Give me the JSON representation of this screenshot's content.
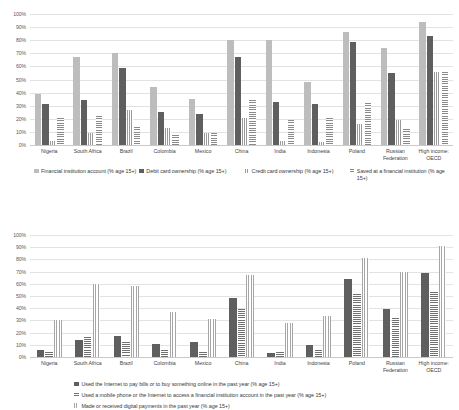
{
  "chart_data": [
    {
      "id": "financial-inclusion-indicators",
      "type": "bar",
      "title": "",
      "xlabel": "",
      "ylabel": "",
      "ylim": [
        0,
        100
      ],
      "ytick_labels": [
        "100%",
        "90%",
        "80%",
        "70%",
        "60%",
        "50%",
        "40%",
        "30%",
        "20%",
        "10%",
        "0%"
      ],
      "ytick_values": [
        100,
        90,
        80,
        70,
        60,
        50,
        40,
        30,
        20,
        10,
        0
      ],
      "grid": true,
      "legend_position": "bottom",
      "categories": [
        "Nigeria",
        "South Africa",
        "Brazil",
        "Colombia",
        "Mexico",
        "China",
        "India",
        "Indonesia",
        "Poland",
        "Russian Federation",
        "High income: OECD"
      ],
      "series": [
        {
          "name": "Financial institution account (% age 15+)",
          "texture": "dotted",
          "values": [
            39,
            67,
            70,
            44,
            35,
            80,
            80,
            48,
            86,
            74,
            94
          ]
        },
        {
          "name": "Debit card ownership (% age 15+)",
          "texture": "solid",
          "values": [
            31,
            34,
            59,
            25,
            24,
            67,
            33,
            31,
            79,
            55,
            83
          ]
        },
        {
          "name": "Credit card ownership (% age 15+)",
          "texture": "vstripe",
          "values": [
            3,
            9,
            27,
            13,
            9,
            21,
            3,
            2,
            16,
            19,
            56
          ]
        },
        {
          "name": "Saved at a financial institution (% age 15+)",
          "texture": "hstripe",
          "values": [
            21,
            22,
            14,
            8,
            9,
            34,
            19,
            21,
            32,
            12,
            56
          ]
        }
      ]
    },
    {
      "id": "digital-payments-indicators",
      "type": "bar",
      "title": "",
      "xlabel": "",
      "ylabel": "",
      "ylim": [
        0,
        100
      ],
      "ytick_labels": [
        "100%",
        "90%",
        "80%",
        "70%",
        "60%",
        "50%",
        "40%",
        "30%",
        "20%",
        "10%",
        "0%"
      ],
      "ytick_values": [
        100,
        90,
        80,
        70,
        60,
        50,
        40,
        30,
        20,
        10,
        0
      ],
      "grid": true,
      "legend_position": "bottom",
      "categories": [
        "Nigeria",
        "South Africa",
        "Brazil",
        "Colombia",
        "Mexico",
        "China",
        "India",
        "Indonesia",
        "Poland",
        "Russian Federation",
        "High income: OECD"
      ],
      "series": [
        {
          "name": "Used the Internet to pay bills or to buy something online in the past year (% age 15+)",
          "texture": "solid",
          "values": [
            6,
            14,
            17,
            11,
            12,
            48,
            3,
            10,
            64,
            39,
            69
          ]
        },
        {
          "name": "Used a mobile phone or the Internet to access a financial institution account in the past year (% age 15+)",
          "texture": "hstripe",
          "values": [
            4,
            16,
            12,
            6,
            4,
            39,
            4,
            6,
            52,
            32,
            53
          ]
        },
        {
          "name": "Made or received digital payments in the past year (% age 15+)",
          "texture": "vstripe",
          "values": [
            30,
            60,
            58,
            37,
            31,
            67,
            28,
            34,
            81,
            70,
            91
          ]
        }
      ]
    }
  ]
}
